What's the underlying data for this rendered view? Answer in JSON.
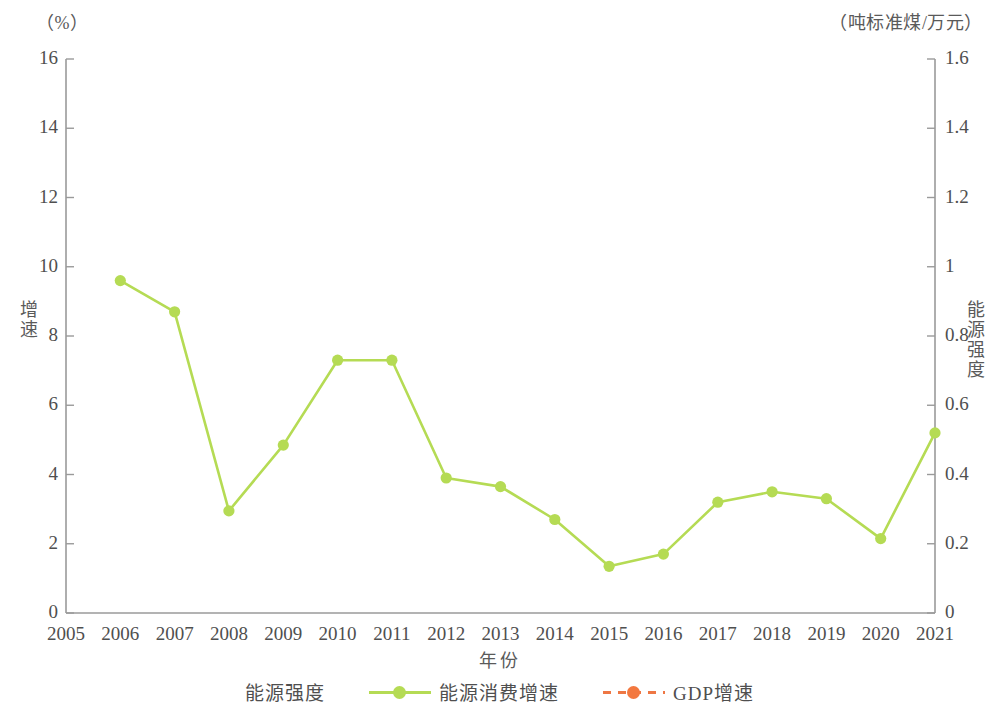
{
  "chart_data": {
    "type": "line",
    "title": "",
    "xlabel": "年份",
    "x": [
      2005,
      2006,
      2007,
      2008,
      2009,
      2010,
      2011,
      2012,
      2013,
      2014,
      2015,
      2016,
      2017,
      2018,
      2019,
      2020,
      2021
    ],
    "x_tick_labels": [
      "2005",
      "2006",
      "2007",
      "2008",
      "2009",
      "2010",
      "2011",
      "2012",
      "2013",
      "2014",
      "2015",
      "2016",
      "2017",
      "2018",
      "2019",
      "2020",
      "2021"
    ],
    "grid": false,
    "legend_position": "bottom",
    "legend_prefix_label": "能源强度",
    "axes": {
      "left": {
        "label": "增速",
        "unit": "（%）",
        "min": 0,
        "max": 16,
        "step": 2,
        "tick_labels": [
          "0",
          "2",
          "4",
          "6",
          "8",
          "10",
          "12",
          "14",
          "16"
        ]
      },
      "right": {
        "label": "能源强度",
        "unit": "（吨标准煤/万元）",
        "min": 0,
        "max": 1.6,
        "step": 0.2,
        "tick_labels": [
          "0",
          "0.2",
          "0.4",
          "0.6",
          "0.8",
          "1",
          "1.2",
          "1.4",
          "1.6"
        ]
      }
    },
    "series": [
      {
        "name": "能源消费增速",
        "axis": "left",
        "color": "#b5db54",
        "line_style": "solid",
        "marker": "circle",
        "x": [
          2006,
          2007,
          2008,
          2009,
          2010,
          2011,
          2012,
          2013,
          2014,
          2015,
          2016,
          2017,
          2018,
          2019,
          2020,
          2021
        ],
        "values": [
          9.6,
          8.7,
          2.95,
          4.85,
          7.3,
          7.3,
          3.9,
          3.65,
          2.7,
          1.35,
          1.7,
          3.2,
          3.5,
          3.3,
          2.15,
          5.2
        ]
      },
      {
        "name": "GDP增速",
        "axis": "right",
        "color": "#f3783f",
        "line_style": "dashed",
        "marker": "circle",
        "x": [
          2006,
          2007,
          2008,
          2009,
          2010,
          2011,
          2012,
          2013,
          2014,
          2015,
          2016,
          2017,
          2018,
          2019,
          2020,
          2021
        ],
        "values": [
          12.7,
          14.25,
          9.7,
          9.4,
          10.6,
          9.6,
          7.9,
          7.8,
          7.4,
          7.0,
          6.8,
          6.9,
          6.65,
          6.0,
          2.2,
          8.1
        ]
      }
    ]
  },
  "colors": {
    "green": "#b5db54",
    "orange": "#f3783f",
    "orange_line": "#ee7744",
    "axis": "#9a9a9a",
    "text": "#4f4f4f"
  }
}
